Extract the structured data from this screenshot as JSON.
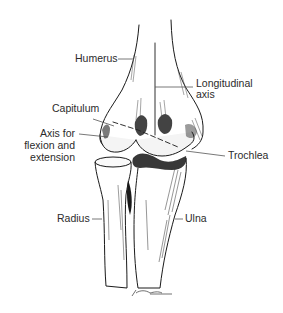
{
  "figure": {
    "labels": {
      "humerus": "Humerus",
      "longitudinal_axis_line1": "Longitudinal",
      "longitudinal_axis_line2": "axis",
      "capitulum": "Capitulum",
      "axis_flex_line1": "Axis for",
      "axis_flex_line2": "flexion and",
      "axis_flex_line3": "extension",
      "trochlea": "Trochlea",
      "radius": "Radius",
      "ulna": "Ulna"
    },
    "signature": "J. Marsden",
    "colors": {
      "background": "#ffffff",
      "ink": "#1a1a1a",
      "label_text": "#2b2b2b",
      "leader_line": "#555555"
    }
  }
}
